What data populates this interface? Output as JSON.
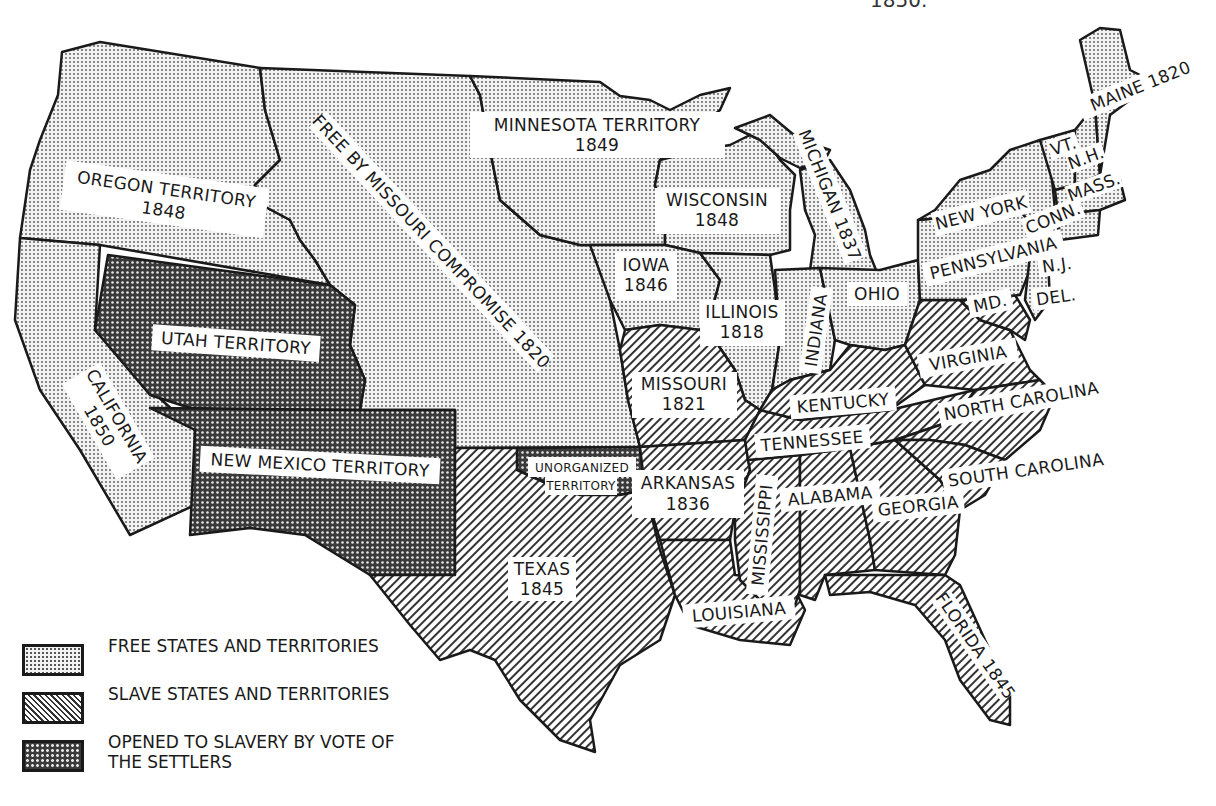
{
  "title_fragment": "1850.",
  "map": {
    "regions": [
      {
        "name": "Oregon Territory",
        "year": "1848",
        "status": "free"
      },
      {
        "name": "Minnesota Territory",
        "year": "1849",
        "status": "free"
      },
      {
        "name": "Free by Missouri Compromise",
        "year": "1820",
        "status": "free"
      },
      {
        "name": "Wisconsin",
        "year": "1848",
        "status": "free"
      },
      {
        "name": "Michigan",
        "year": "1837",
        "status": "free"
      },
      {
        "name": "Iowa",
        "year": "1846",
        "status": "free"
      },
      {
        "name": "Illinois",
        "year": "1818",
        "status": "free"
      },
      {
        "name": "Indiana",
        "year": "",
        "status": "free"
      },
      {
        "name": "Ohio",
        "year": "",
        "status": "free"
      },
      {
        "name": "California",
        "year": "1850",
        "status": "free"
      },
      {
        "name": "Utah Territory",
        "year": "",
        "status": "popular-sovereignty"
      },
      {
        "name": "New Mexico Territory",
        "year": "",
        "status": "popular-sovereignty"
      },
      {
        "name": "Unorganized Territory",
        "year": "",
        "status": "popular-sovereignty"
      },
      {
        "name": "Missouri",
        "year": "1821",
        "status": "slave"
      },
      {
        "name": "Arkansas",
        "year": "1836",
        "status": "slave"
      },
      {
        "name": "Texas",
        "year": "1845",
        "status": "slave"
      },
      {
        "name": "Louisiana",
        "year": "",
        "status": "slave"
      },
      {
        "name": "Mississippi",
        "year": "",
        "status": "slave"
      },
      {
        "name": "Alabama",
        "year": "",
        "status": "slave"
      },
      {
        "name": "Georgia",
        "year": "",
        "status": "slave"
      },
      {
        "name": "Florida",
        "year": "1845",
        "status": "slave"
      },
      {
        "name": "Tennessee",
        "year": "",
        "status": "slave"
      },
      {
        "name": "Kentucky",
        "year": "",
        "status": "slave"
      },
      {
        "name": "Virginia",
        "year": "",
        "status": "slave"
      },
      {
        "name": "North Carolina",
        "year": "",
        "status": "slave"
      },
      {
        "name": "South Carolina",
        "year": "",
        "status": "slave"
      },
      {
        "name": "Maryland",
        "year": "",
        "status": "slave"
      },
      {
        "name": "Delaware",
        "year": "",
        "status": "slave"
      },
      {
        "name": "New York",
        "year": "",
        "status": "free"
      },
      {
        "name": "Pennsylvania",
        "year": "",
        "status": "free"
      },
      {
        "name": "New Jersey",
        "year": "",
        "status": "free"
      },
      {
        "name": "Connecticut",
        "year": "",
        "status": "free"
      },
      {
        "name": "Massachusetts",
        "year": "",
        "status": "free"
      },
      {
        "name": "New Hampshire",
        "year": "",
        "status": "free"
      },
      {
        "name": "Vermont",
        "year": "",
        "status": "free"
      },
      {
        "name": "Maine",
        "year": "1820",
        "status": "free"
      }
    ],
    "labels": {
      "oregon": "OREGON TERRITORY",
      "oregon_year": "1848",
      "minnesota": "MINNESOTA TERRITORY",
      "minnesota_year": "1849",
      "missouri_compromise": "FREE BY MISSOURI COMPROMISE 1820",
      "wisconsin": "WISCONSIN",
      "wisconsin_year": "1848",
      "michigan": "MICHIGAN 1837",
      "iowa": "IOWA",
      "iowa_year": "1846",
      "illinois": "ILLINOIS",
      "illinois_year": "1818",
      "indiana": "INDIANA",
      "ohio": "OHIO",
      "california": "CALIFORNIA",
      "california_year": "1850",
      "utah": "UTAH TERRITORY",
      "new_mexico": "NEW MEXICO TERRITORY",
      "unorganized_1": "UNORGANIZED",
      "unorganized_2": "TERRITORY",
      "missouri": "MISSOURI",
      "missouri_year": "1821",
      "arkansas": "ARKANSAS",
      "arkansas_year": "1836",
      "texas": "TEXAS",
      "texas_year": "1845",
      "louisiana": "LOUISIANA",
      "mississippi": "MISSISSIPPI",
      "alabama": "ALABAMA",
      "georgia": "GEORGIA",
      "florida": "FLORIDA 1845",
      "tennessee": "TENNESSEE",
      "kentucky": "KENTUCKY",
      "virginia": "VIRGINIA",
      "north_carolina": "NORTH CAROLINA",
      "south_carolina": "SOUTH CAROLINA",
      "maryland": "MD.",
      "delaware": "DEL.",
      "new_york": "NEW YORK",
      "pennsylvania": "PENNSYLVANIA",
      "new_jersey": "N.J.",
      "connecticut": "CONN.",
      "massachusetts": "MASS.",
      "new_hampshire": "N.H.",
      "vermont": "VT.",
      "maine": "MAINE 1820"
    }
  },
  "legend": {
    "items": [
      {
        "label": "FREE STATES AND TERRITORIES",
        "pattern": "dots"
      },
      {
        "label": "SLAVE STATES AND TERRITORIES",
        "pattern": "diagonal-lines"
      },
      {
        "label": "OPENED TO SLAVERY BY VOTE OF THE SETTLERS",
        "pattern": "dense-crosshatch"
      }
    ]
  },
  "colors": {
    "ink": "#1a1a1a",
    "paper": "#ffffff"
  }
}
